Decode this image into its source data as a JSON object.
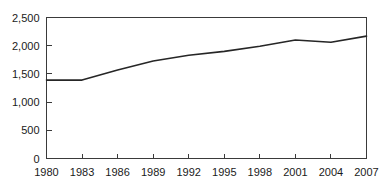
{
  "chart_data": {
    "type": "line",
    "title": "",
    "subtitle": "",
    "xlabel": "",
    "ylabel": "",
    "x": [
      1980,
      1983,
      1986,
      1989,
      1992,
      1995,
      1998,
      2001,
      2004,
      2007
    ],
    "categories": [
      "1980",
      "1983",
      "1986",
      "1989",
      "1992",
      "1995",
      "1998",
      "2001",
      "2004",
      "2007"
    ],
    "values": [
      1390,
      1390,
      1570,
      1730,
      1830,
      1900,
      1990,
      2100,
      2060,
      2170
    ],
    "series": [
      {
        "name": "",
        "values": [
          1390,
          1390,
          1570,
          1730,
          1830,
          1900,
          1990,
          2100,
          2060,
          2170
        ]
      }
    ],
    "xlim": [
      1980,
      2007
    ],
    "ylim": [
      0,
      2500
    ],
    "y_ticks": [
      0,
      500,
      1000,
      1500,
      2000,
      2500
    ],
    "y_tick_labels": [
      "0",
      "500",
      "1,000",
      "1,500",
      "2,000",
      "2,500"
    ],
    "x_ticks": [
      1980,
      1983,
      1986,
      1989,
      1992,
      1995,
      1998,
      2001,
      2004,
      2007
    ],
    "x_tick_labels": [
      "1980",
      "1983",
      "1986",
      "1989",
      "1992",
      "1995",
      "1998",
      "2001",
      "2004",
      "2007"
    ],
    "grid": false,
    "legend": false,
    "legend_position": "none",
    "annotations": [],
    "line_color": "#262626",
    "axis_color": "#3a3a3a",
    "background_color": "#ffffff"
  }
}
